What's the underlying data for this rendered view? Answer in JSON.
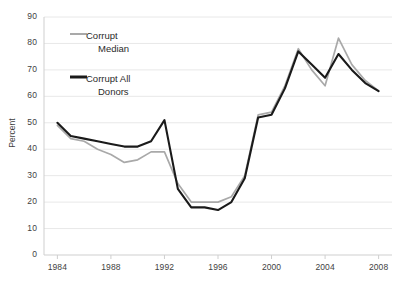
{
  "chart_data": {
    "type": "line",
    "title": "",
    "xlabel": "",
    "ylabel": "Percent",
    "xlim": [
      1983,
      2009
    ],
    "ylim": [
      0,
      90
    ],
    "grid": "horizontal",
    "legend_position": "inside-top-left",
    "y_ticks": [
      0,
      10,
      20,
      30,
      40,
      50,
      60,
      70,
      80,
      90
    ],
    "x_ticks": [
      1984,
      1988,
      1992,
      1996,
      2000,
      2004,
      2008
    ],
    "x": [
      1984,
      1985,
      1986,
      1987,
      1988,
      1989,
      1990,
      1991,
      1992,
      1993,
      1994,
      1995,
      1996,
      1997,
      1998,
      1999,
      2000,
      2001,
      2002,
      2003,
      2004,
      2005,
      2006,
      2007,
      2008
    ],
    "series": [
      {
        "name": "Corrupt Median",
        "color": "#a9a9a9",
        "values": [
          49,
          44,
          43,
          40,
          38,
          35,
          36,
          39,
          39,
          27,
          20,
          20,
          20,
          22,
          30,
          53,
          54,
          64,
          78,
          70,
          64,
          82,
          72,
          66,
          62
        ]
      },
      {
        "name": "Corrupt All Donors",
        "color": "#1a1a1a",
        "values": [
          50,
          45,
          44,
          43,
          42,
          41,
          41,
          43,
          51,
          25,
          18,
          18,
          17,
          20,
          29,
          52,
          53,
          63,
          77,
          72,
          67,
          76,
          70,
          65,
          62
        ]
      }
    ]
  },
  "legend": {
    "entries": [
      {
        "label_line1": "Corrupt",
        "label_line2": "Median",
        "color": "#a9a9a9"
      },
      {
        "label_line1": "Corrupt All",
        "label_line2": "Donors",
        "color": "#1a1a1a"
      }
    ]
  },
  "axes": {
    "y_title": "Percent",
    "y_tick_labels": [
      "90",
      "80",
      "70",
      "60",
      "50",
      "40",
      "30",
      "20",
      "10",
      "0"
    ],
    "x_tick_labels": [
      "1984",
      "1988",
      "1992",
      "1996",
      "2000",
      "2004",
      "2008"
    ]
  }
}
